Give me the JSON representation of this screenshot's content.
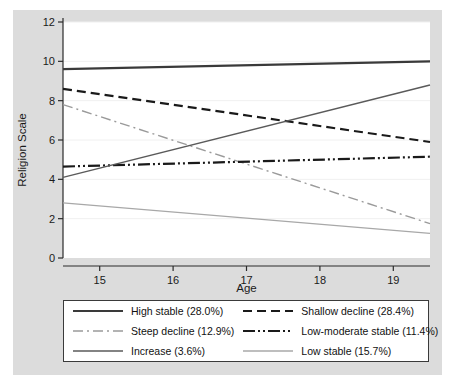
{
  "chart_data": {
    "type": "line",
    "title": "",
    "xlabel": "Age",
    "ylabel": "Religion Scale",
    "xlim": [
      14.5,
      19.5
    ],
    "ylim": [
      0,
      12
    ],
    "xticks": [
      15,
      16,
      17,
      18,
      19
    ],
    "yticks": [
      0,
      2,
      4,
      6,
      8,
      10,
      12
    ],
    "grid": true,
    "legend_position": "bottom",
    "x": [
      14.5,
      19.5
    ],
    "series": [
      {
        "name": "High stable (28.0%)",
        "label": "High stable (28.0%)",
        "style": "solid",
        "color": "#3a3a3a",
        "width": 2.2,
        "values": [
          9.6,
          10.0
        ]
      },
      {
        "name": "Shallow decline (28.4%)",
        "label": "Shallow decline (28.4%)",
        "style": "dashed",
        "color": "#1a1a1a",
        "width": 2.2,
        "values": [
          8.6,
          5.9
        ]
      },
      {
        "name": "Steep decline (12.9%)",
        "label": "Steep decline (12.9%)",
        "style": "dashdot",
        "color": "#9a9a9a",
        "width": 1.4,
        "values": [
          7.8,
          1.75
        ]
      },
      {
        "name": "Low-moderate stable (11.4%)",
        "label": "Low-moderate stable (11.4%)",
        "style": "dashdotdot",
        "color": "#1a1a1a",
        "width": 2.2,
        "values": [
          4.65,
          5.15
        ]
      },
      {
        "name": "Increase (3.6%)",
        "label": "Increase (3.6%)",
        "style": "solid",
        "color": "#5a5a5a",
        "width": 1.5,
        "values": [
          4.1,
          8.8
        ]
      },
      {
        "name": "Low stable (15.7%)",
        "label": "Low stable (15.7%)",
        "style": "solid",
        "color": "#a8a8a8",
        "width": 1.3,
        "values": [
          2.8,
          1.25
        ]
      }
    ]
  },
  "colors": {
    "panel_background": "#dcdcdc",
    "plot_background": "#ffffff",
    "axis": "#2b2b2b",
    "gridline": "#f0f0f0",
    "text": "#1a1a1a"
  }
}
